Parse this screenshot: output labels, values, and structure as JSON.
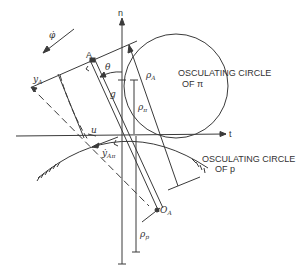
{
  "diagram": {
    "colors": {
      "line": "#3a3a3a",
      "background": "#ffffff",
      "text": "#333333"
    },
    "axes": {
      "normal_label": "n",
      "tangent_label": "t"
    },
    "labels": {
      "phi_dot": "φ̇",
      "point_A": "A",
      "theta": "θ",
      "g": "g",
      "rho_A": "ρ",
      "rho_A_sub": "A",
      "rho_pi": "ρ",
      "rho_pi_sub": "π",
      "rho_p": "ρ",
      "rho_p_sub": "p",
      "y_A": "y",
      "y_A_sub": "A",
      "y_dot_A": "ẏ",
      "y_dot_A_sub": "Aπ",
      "u": "u",
      "O_A": "O",
      "O_A_sub": "A"
    },
    "annotations": {
      "circle_pi_line1": "OSCULATING CIRCLE",
      "circle_pi_line2": "OF  π",
      "circle_p_line1": "OSCULATING CIRCLE",
      "circle_p_line2": "OF  p"
    }
  }
}
